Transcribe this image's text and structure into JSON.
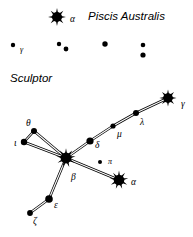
{
  "chart_data": {
    "type": "scatter",
    "xlabel": "",
    "ylabel": "",
    "xlim": [
      0,
      193
    ],
    "ylim": [
      0,
      237
    ],
    "grid": false,
    "legend": null,
    "constellations": [
      {
        "name": "Piscis Australis",
        "label_x": 88,
        "label_y": 20,
        "stars": [
          {
            "id": "pa-alpha",
            "label": "α",
            "label_x": 70,
            "label_y": 22,
            "x": 57,
            "y": 17,
            "magnitude_class": "bright",
            "symbol": "sunburst",
            "radius": 6.5,
            "spikes": 8
          },
          {
            "id": "pa-gamma",
            "label": "γ",
            "label_x": 20,
            "label_y": 52,
            "x": 13,
            "y": 45,
            "magnitude_class": "faint",
            "symbol": "dot",
            "radius": 2.2
          },
          {
            "id": "pa-s1",
            "label": "",
            "label_x": 0,
            "label_y": 0,
            "x": 59,
            "y": 44,
            "magnitude_class": "faint",
            "symbol": "dot",
            "radius": 2.2
          },
          {
            "id": "pa-s2",
            "label": "",
            "label_x": 0,
            "label_y": 0,
            "x": 66,
            "y": 49,
            "magnitude_class": "faint",
            "symbol": "dot",
            "radius": 2.4
          },
          {
            "id": "pa-s3",
            "label": "",
            "label_x": 0,
            "label_y": 0,
            "x": 105,
            "y": 44,
            "magnitude_class": "faint",
            "symbol": "dot",
            "radius": 2.7
          },
          {
            "id": "pa-s4",
            "label": "",
            "label_x": 0,
            "label_y": 0,
            "x": 143,
            "y": 45,
            "magnitude_class": "faint",
            "symbol": "dot",
            "radius": 2.3
          },
          {
            "id": "pa-s5",
            "label": "",
            "label_x": 0,
            "label_y": 0,
            "x": 143,
            "y": 55,
            "magnitude_class": "faint",
            "symbol": "dot",
            "radius": 2.6
          }
        ],
        "lines": []
      },
      {
        "name": "Sculptor",
        "label_x": 10,
        "label_y": 82,
        "stars": [
          {
            "id": "sc-gamma",
            "label": "γ",
            "label_x": 181,
            "label_y": 107,
            "x": 168,
            "y": 98,
            "magnitude_class": "bright",
            "symbol": "sunburst",
            "radius": 6.2,
            "spikes": 8
          },
          {
            "id": "sc-lambda",
            "label": "λ",
            "label_x": 140,
            "label_y": 125,
            "x": 136,
            "y": 113,
            "magnitude_class": "medium",
            "symbol": "dot",
            "radius": 3.0
          },
          {
            "id": "sc-mu",
            "label": "μ",
            "label_x": 117,
            "label_y": 137,
            "x": 113,
            "y": 126,
            "magnitude_class": "medium",
            "symbol": "dot",
            "radius": 2.6
          },
          {
            "id": "sc-delta",
            "label": "δ",
            "label_x": 95,
            "label_y": 148,
            "x": 90,
            "y": 141,
            "magnitude_class": "medium",
            "symbol": "dot",
            "radius": 3.6
          },
          {
            "id": "sc-beta",
            "label": "β",
            "label_x": 71,
            "label_y": 180,
            "x": 66,
            "y": 158,
            "magnitude_class": "bright",
            "symbol": "sunburst",
            "radius": 7.0,
            "spikes": 9
          },
          {
            "id": "sc-theta",
            "label": "θ",
            "label_x": 26,
            "label_y": 126,
            "x": 34,
            "y": 131,
            "magnitude_class": "medium",
            "symbol": "dot",
            "radius": 3.0
          },
          {
            "id": "sc-iota",
            "label": "ι",
            "label_x": 14,
            "label_y": 146,
            "x": 24,
            "y": 142,
            "magnitude_class": "medium",
            "symbol": "dot",
            "radius": 3.2
          },
          {
            "id": "sc-epsilon",
            "label": "ε",
            "label_x": 54,
            "label_y": 208,
            "x": 49,
            "y": 199,
            "magnitude_class": "medium",
            "symbol": "dot",
            "radius": 3.8
          },
          {
            "id": "sc-zeta",
            "label": "ζ",
            "label_x": 33,
            "label_y": 224,
            "x": 30,
            "y": 213,
            "magnitude_class": "medium",
            "symbol": "dot",
            "radius": 2.9
          },
          {
            "id": "sc-alpha",
            "label": "α",
            "label_x": 131,
            "label_y": 185,
            "x": 119,
            "y": 180,
            "magnitude_class": "bright",
            "symbol": "sunburst",
            "radius": 6.8,
            "spikes": 9
          },
          {
            "id": "sc-pi",
            "label": "π",
            "label_x": 108,
            "label_y": 164,
            "x": 100,
            "y": 162,
            "magnitude_class": "faint",
            "symbol": "dot",
            "radius": 2.0
          }
        ],
        "lines": [
          {
            "from": "sc-gamma",
            "to": "sc-lambda"
          },
          {
            "from": "sc-lambda",
            "to": "sc-mu"
          },
          {
            "from": "sc-mu",
            "to": "sc-delta"
          },
          {
            "from": "sc-delta",
            "to": "sc-beta"
          },
          {
            "from": "sc-beta",
            "to": "sc-theta"
          },
          {
            "from": "sc-beta",
            "to": "sc-iota"
          },
          {
            "from": "sc-theta",
            "to": "sc-iota"
          },
          {
            "from": "sc-beta",
            "to": "sc-epsilon"
          },
          {
            "from": "sc-epsilon",
            "to": "sc-zeta"
          },
          {
            "from": "sc-beta",
            "to": "sc-alpha"
          }
        ]
      }
    ]
  },
  "style": {
    "star_color": "#000000",
    "line_color": "#000000",
    "background": "#ffffff",
    "line_outer_width": 2.6,
    "line_inner_width": 1.1
  }
}
